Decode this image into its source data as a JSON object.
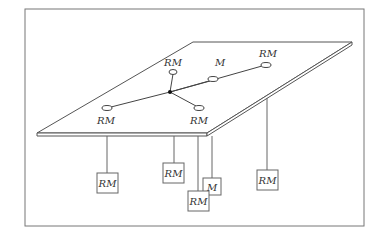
{
  "diagram": {
    "type": "network-topology",
    "colors": {
      "line": "#555555",
      "frame": "#777777",
      "background": "#ffffff",
      "text": "#333333"
    },
    "frame": {
      "x": 25,
      "y": 9,
      "w": 339,
      "h": 217
    },
    "plane": {
      "points": "193,42 352,42 207,133 37,133",
      "thickness": 3
    },
    "hub": {
      "x": 170,
      "y": 92
    },
    "plane_nodes": [
      {
        "id": "node-rm-top",
        "label": "RM",
        "x": 173,
        "y": 72,
        "lx": 173,
        "ly": 66
      },
      {
        "id": "node-m",
        "label": "M",
        "x": 213,
        "y": 79,
        "lx": 220,
        "ly": 66
      },
      {
        "id": "node-rm-right",
        "label": "RM",
        "x": 266,
        "y": 65,
        "lx": 268,
        "ly": 57
      },
      {
        "id": "node-rm-left",
        "label": "RM",
        "x": 107,
        "y": 108,
        "lx": 106,
        "ly": 124
      },
      {
        "id": "node-rm-bottom",
        "label": "RM",
        "x": 199,
        "y": 108,
        "lx": 199,
        "ly": 124
      }
    ],
    "hanging_boxes": [
      {
        "id": "box-rm-1",
        "label": "RM",
        "x": 107,
        "y1": 136,
        "by": 173
      },
      {
        "id": "box-rm-2",
        "label": "RM",
        "x": 174,
        "y1": 136,
        "by": 163
      },
      {
        "id": "box-rm-3",
        "label": "RM",
        "x": 198,
        "y1": 136,
        "by": 201
      },
      {
        "id": "box-m",
        "label": "M",
        "x": 212,
        "y1": 136,
        "by": 184
      },
      {
        "id": "box-rm-4",
        "label": "RM",
        "x": 267,
        "y1": 98,
        "by": 170
      }
    ]
  }
}
